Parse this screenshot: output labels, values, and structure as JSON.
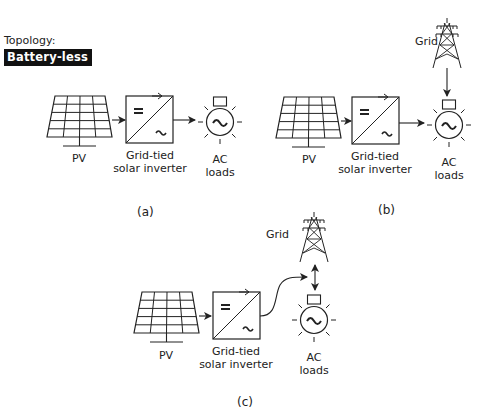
{
  "topology": {
    "title": "Topology:",
    "badge": "Battery-less"
  },
  "labels": {
    "pv": "PV",
    "inverter_line1": "Grid-tied",
    "inverter_line2": "solar inverter",
    "ac_line1": "AC",
    "ac_line2": "loads",
    "grid": "Grid"
  },
  "inverter_symbols": {
    "dc": "=",
    "ac": "~"
  },
  "captions": {
    "a": "(a)",
    "b": "(b)",
    "c": "(c)"
  },
  "colors": {
    "stroke": "#222222",
    "badge_bg": "#111111",
    "badge_text": "#ffffff",
    "background": "#ffffff"
  }
}
